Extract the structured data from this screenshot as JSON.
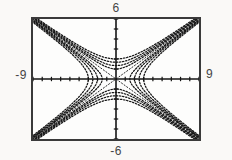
{
  "figure": {
    "labels": {
      "top": "6",
      "bottom": "-6",
      "left": "-9",
      "right": "9"
    }
  },
  "chart_data": {
    "type": "line",
    "title": "",
    "xlabel": "",
    "ylabel": "",
    "window": {
      "xmin": -9,
      "xmax": 9,
      "ymin": -6,
      "ymax": 6
    },
    "ticks": {
      "x_interval": 1,
      "y_interval": 1,
      "tick_half_len_px": 2.2
    },
    "grid": false,
    "legend": false,
    "family": {
      "a": 3,
      "b": 2,
      "m_values": [
        0.25,
        0.45,
        0.7,
        1
      ],
      "series": [
        {
          "name": "left-right hyperbolas x^2/9 - y^2/4 = m",
          "m_values": [
            0.25,
            0.45,
            0.7,
            1
          ]
        },
        {
          "name": "up-down hyperbolas y^2/4 - x^2/9 = m",
          "m_values": [
            0.25,
            0.45,
            0.7,
            1
          ]
        },
        {
          "name": "asymptotes y = 2x/3 and y = -2x/3"
        }
      ]
    },
    "style": {
      "axis_color": "#141414",
      "curve_color": "#161616",
      "asymptote_color": "#2b2b2b",
      "frame_color": "#3a3a3a",
      "background": "#fdfdfc",
      "curve_width": 1.25,
      "axis_width": 1.6,
      "curve_dash": "1.4 1.7",
      "asymptote_dash": "2 1.2"
    }
  }
}
